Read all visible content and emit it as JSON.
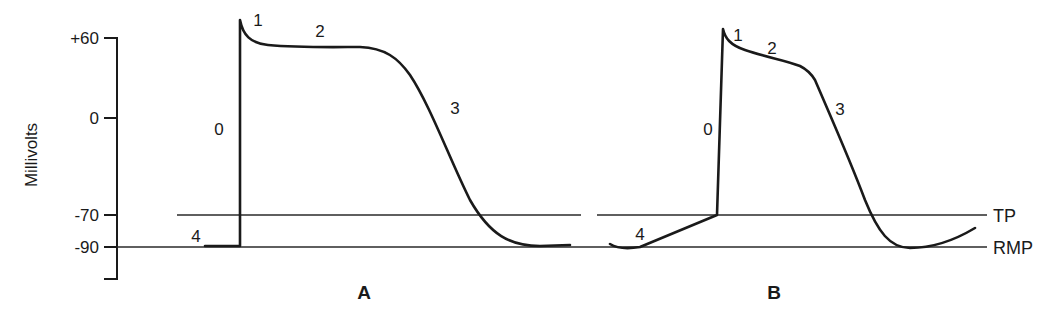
{
  "figure": {
    "y_axis": {
      "label": "Millivolts",
      "ticks": [
        {
          "label": "+60",
          "value": 60
        },
        {
          "label": "0",
          "value": 0
        },
        {
          "label": "-70",
          "value": -70
        },
        {
          "label": "-90",
          "value": -90
        }
      ]
    },
    "reference_lines": {
      "tp": {
        "label": "TP",
        "value": -70
      },
      "rmp": {
        "label": "RMP",
        "value": -90
      }
    },
    "panels": [
      {
        "label": "A",
        "phases": [
          "0",
          "1",
          "2",
          "3",
          "4"
        ]
      },
      {
        "label": "B",
        "phases": [
          "0",
          "1",
          "2",
          "3",
          "4"
        ]
      }
    ]
  },
  "colors": {
    "ink": "#1a1a1a",
    "background": "#ffffff"
  }
}
